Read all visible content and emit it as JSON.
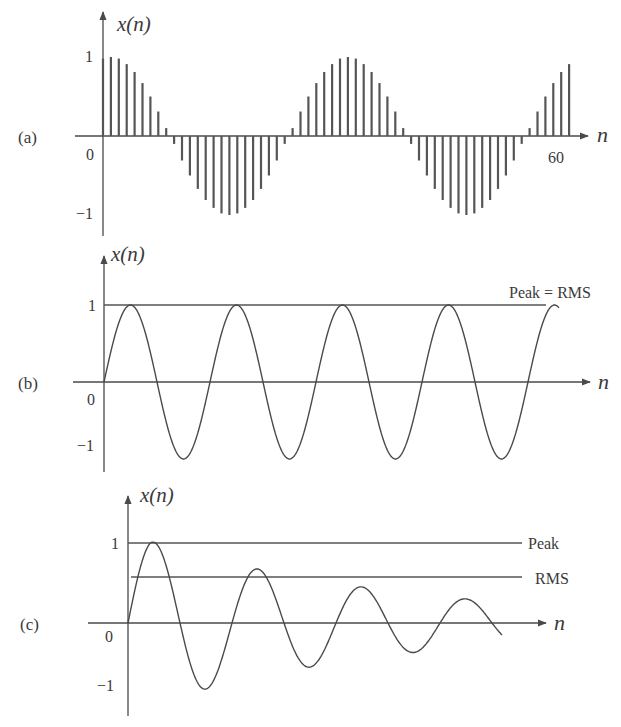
{
  "chart_data": [
    {
      "id": "a",
      "type": "stem",
      "panel_label": "(a)",
      "ylabel": "x(n)",
      "xlabel": "n",
      "y_ticks": [
        "1",
        "0",
        "-1"
      ],
      "x_ticks": [
        "60"
      ],
      "ylim": [
        -1,
        1
      ],
      "xlim": [
        0,
        60
      ],
      "description": "Sampled cosine, period ~30 samples, n = 0..59",
      "n": [
        0,
        1,
        2,
        3,
        4,
        5,
        6,
        7,
        8,
        9,
        10,
        11,
        12,
        13,
        14,
        15,
        16,
        17,
        18,
        19,
        20,
        21,
        22,
        23,
        24,
        25,
        26,
        27,
        28,
        29,
        30,
        31,
        32,
        33,
        34,
        35,
        36,
        37,
        38,
        39,
        40,
        41,
        42,
        43,
        44,
        45,
        46,
        47,
        48,
        49,
        50,
        51,
        52,
        53,
        54,
        55,
        56,
        57,
        58,
        59
      ],
      "values": [
        0.98,
        1.0,
        0.98,
        0.91,
        0.81,
        0.67,
        0.5,
        0.31,
        0.1,
        -0.1,
        -0.31,
        -0.5,
        -0.67,
        -0.81,
        -0.91,
        -0.98,
        -1.0,
        -0.98,
        -0.91,
        -0.81,
        -0.67,
        -0.5,
        -0.31,
        -0.1,
        0.1,
        0.31,
        0.5,
        0.67,
        0.81,
        0.91,
        0.98,
        1.0,
        0.98,
        0.91,
        0.81,
        0.67,
        0.5,
        0.31,
        0.1,
        -0.1,
        -0.31,
        -0.5,
        -0.67,
        -0.81,
        -0.91,
        -0.98,
        -1.0,
        -0.98,
        -0.91,
        -0.81,
        -0.67,
        -0.5,
        -0.31,
        -0.1,
        0.1,
        0.31,
        0.5,
        0.67,
        0.81,
        0.91
      ]
    },
    {
      "id": "b",
      "type": "line",
      "panel_label": "(b)",
      "ylabel": "x(n)",
      "xlabel": "n",
      "y_ticks": [
        "1",
        "0",
        "-1"
      ],
      "ylim": [
        -1,
        1
      ],
      "description": "Continuous sine wave of constant amplitude 1, ~4.3 cycles",
      "cycles": 4.3,
      "amplitude": 1,
      "reference_lines": [
        {
          "label": "Peak = RMS",
          "y": 1
        }
      ]
    },
    {
      "id": "c",
      "type": "line",
      "panel_label": "(c)",
      "ylabel": "x(n)",
      "xlabel": "n",
      "y_ticks": [
        "1",
        "0",
        "-1"
      ],
      "ylim": [
        -1,
        1
      ],
      "description": "Exponentially decaying sine wave, ~3.75 cycles",
      "extrema": [
        {
          "type": "peak",
          "value": 1.0
        },
        {
          "type": "trough",
          "value": -1.05
        },
        {
          "type": "peak",
          "value": 0.76
        },
        {
          "type": "trough",
          "value": -0.8
        },
        {
          "type": "peak",
          "value": 0.51
        },
        {
          "type": "trough",
          "value": -0.56
        },
        {
          "type": "peak",
          "value": 0.32
        },
        {
          "type": "trough",
          "value": -0.33
        }
      ],
      "reference_lines": [
        {
          "label": "Peak",
          "y": 1
        },
        {
          "label": "RMS",
          "y": 0.58
        }
      ]
    }
  ],
  "labels": {
    "a": {
      "panel": "(a)",
      "ylabel": "x(n)",
      "xlabel": "n",
      "one": "1",
      "zero": "0",
      "minus_one": "−1",
      "xtick": "60"
    },
    "b": {
      "panel": "(b)",
      "ylabel": "x(n)",
      "xlabel": "n",
      "one": "1",
      "zero": "0",
      "minus_one": "−1",
      "ref": "Peak = RMS"
    },
    "c": {
      "panel": "(c)",
      "ylabel": "x(n)",
      "xlabel": "n",
      "one": "1",
      "zero": "0",
      "minus_one": "−1",
      "peak": "Peak",
      "rms": "RMS"
    }
  },
  "colors": {
    "ink": "#4a4a4a",
    "text": "#3a3a3a",
    "background": "#ffffff"
  }
}
